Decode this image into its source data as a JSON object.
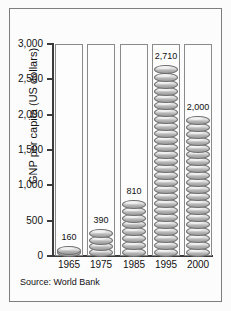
{
  "figure": {
    "source_note": "Source: World Bank"
  },
  "chart_data": {
    "type": "bar",
    "title": "",
    "xlabel": "",
    "ylabel": "GNP per capita (US dollars)",
    "categories": [
      "1965",
      "1975",
      "1985",
      "1995",
      "2000"
    ],
    "values": [
      160,
      390,
      810,
      2710,
      2000
    ],
    "value_labels": [
      "160",
      "390",
      "810",
      "2,710",
      "2,000"
    ],
    "ylim": [
      0,
      3000
    ],
    "ytick_values": [
      0,
      500,
      1000,
      1500,
      2000,
      2500,
      3000
    ],
    "ytick_labels": [
      "0",
      "500",
      "1,000",
      "1,500",
      "2,000",
      "2,500",
      "3,000"
    ],
    "grid": false,
    "legend": null,
    "pictograph": {
      "symbol": "coin",
      "unit_value": 100
    },
    "colors": {
      "coin_light": "#e6e6e6",
      "coin_dark": "#9a9a9a",
      "coin_outline": "#6f6f6f",
      "axis": "#3b3b3b",
      "column_border": "#8a8a8a",
      "background": "#fbfbfb"
    }
  }
}
